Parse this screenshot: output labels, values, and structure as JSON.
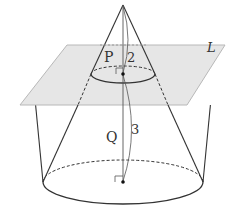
{
  "figure": {
    "type": "cone-with-cutting-plane",
    "labels": {
      "plane": "L",
      "upper_solid": "P",
      "lower_solid": "Q",
      "upper_height": "2",
      "lower_height": "3"
    },
    "colors": {
      "plane_fill": "#e6e6e6",
      "plane_edge": "#b8b8b8",
      "line": "#333333"
    }
  }
}
